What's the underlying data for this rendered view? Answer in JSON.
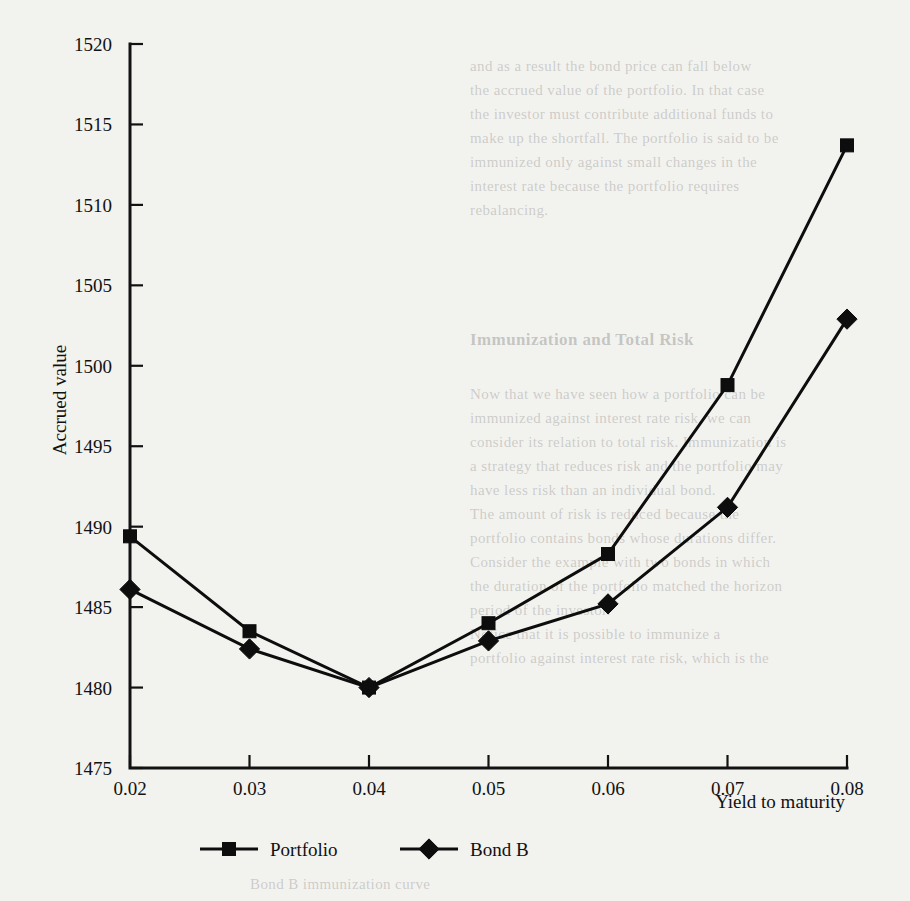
{
  "chart_data": {
    "type": "line",
    "title": "",
    "xlabel": "Yield to maturity",
    "ylabel": "Accrued value",
    "x": [
      0.02,
      0.03,
      0.04,
      0.05,
      0.06,
      0.07,
      0.08
    ],
    "xtick_labels": [
      "0.02",
      "0.03",
      "0.04",
      "0.05",
      "0.06",
      "0.07",
      "0.08"
    ],
    "ytick_labels": [
      "1475",
      "1480",
      "1485",
      "1490",
      "1495",
      "1500",
      "1505",
      "1510",
      "1515",
      "1520"
    ],
    "ytick_values": [
      1475,
      1480,
      1485,
      1490,
      1495,
      1500,
      1505,
      1510,
      1515,
      1520
    ],
    "xlim": [
      0.02,
      0.08
    ],
    "ylim": [
      1475,
      1520
    ],
    "grid": false,
    "legend_position": "bottom",
    "series": [
      {
        "name": "Portfolio",
        "marker": "square",
        "color": "#0d0d0d",
        "values": [
          1489.4,
          1483.5,
          1480.0,
          1484.0,
          1488.3,
          1498.8,
          1513.7
        ]
      },
      {
        "name": "Bond B",
        "marker": "diamond",
        "color": "#0d0d0d",
        "values": [
          1486.1,
          1482.4,
          1480.0,
          1482.9,
          1485.2,
          1491.2,
          1502.9
        ]
      }
    ]
  },
  "legend": {
    "items": [
      {
        "label": "Portfolio",
        "marker": "square"
      },
      {
        "label": "Bond B",
        "marker": "diamond"
      }
    ]
  },
  "axes": {
    "y_title": "Accrued value",
    "x_title": "Yield to maturity"
  },
  "bleed_text": {
    "lines": [
      "and as a result the bond price can fall below",
      "the accrued value of the portfolio. In that case",
      "the investor must contribute additional funds to",
      "make up the shortfall. The portfolio is said to be",
      "immunized only against small changes in the",
      "interest rate because the portfolio requires",
      "rebalancing."
    ],
    "heading": "Immunization and Total Risk",
    "lines2": [
      "Now that we have seen how a portfolio can be",
      "immunized against interest rate risk, we can",
      "consider its relation to total risk. Immunization is",
      "a strategy that reduces risk and the portfolio may",
      "have less risk than an individual bond.",
      "The amount of risk is reduced because the",
      "portfolio contains bonds whose durations differ.",
      "Consider the example with two bonds in which",
      "the duration of the portfolio matched the horizon",
      "period of the investor.",
      "Notice that it is possible to immunize a",
      "portfolio against interest rate risk, which is the"
    ],
    "footer": "Bond B immunization curve"
  }
}
